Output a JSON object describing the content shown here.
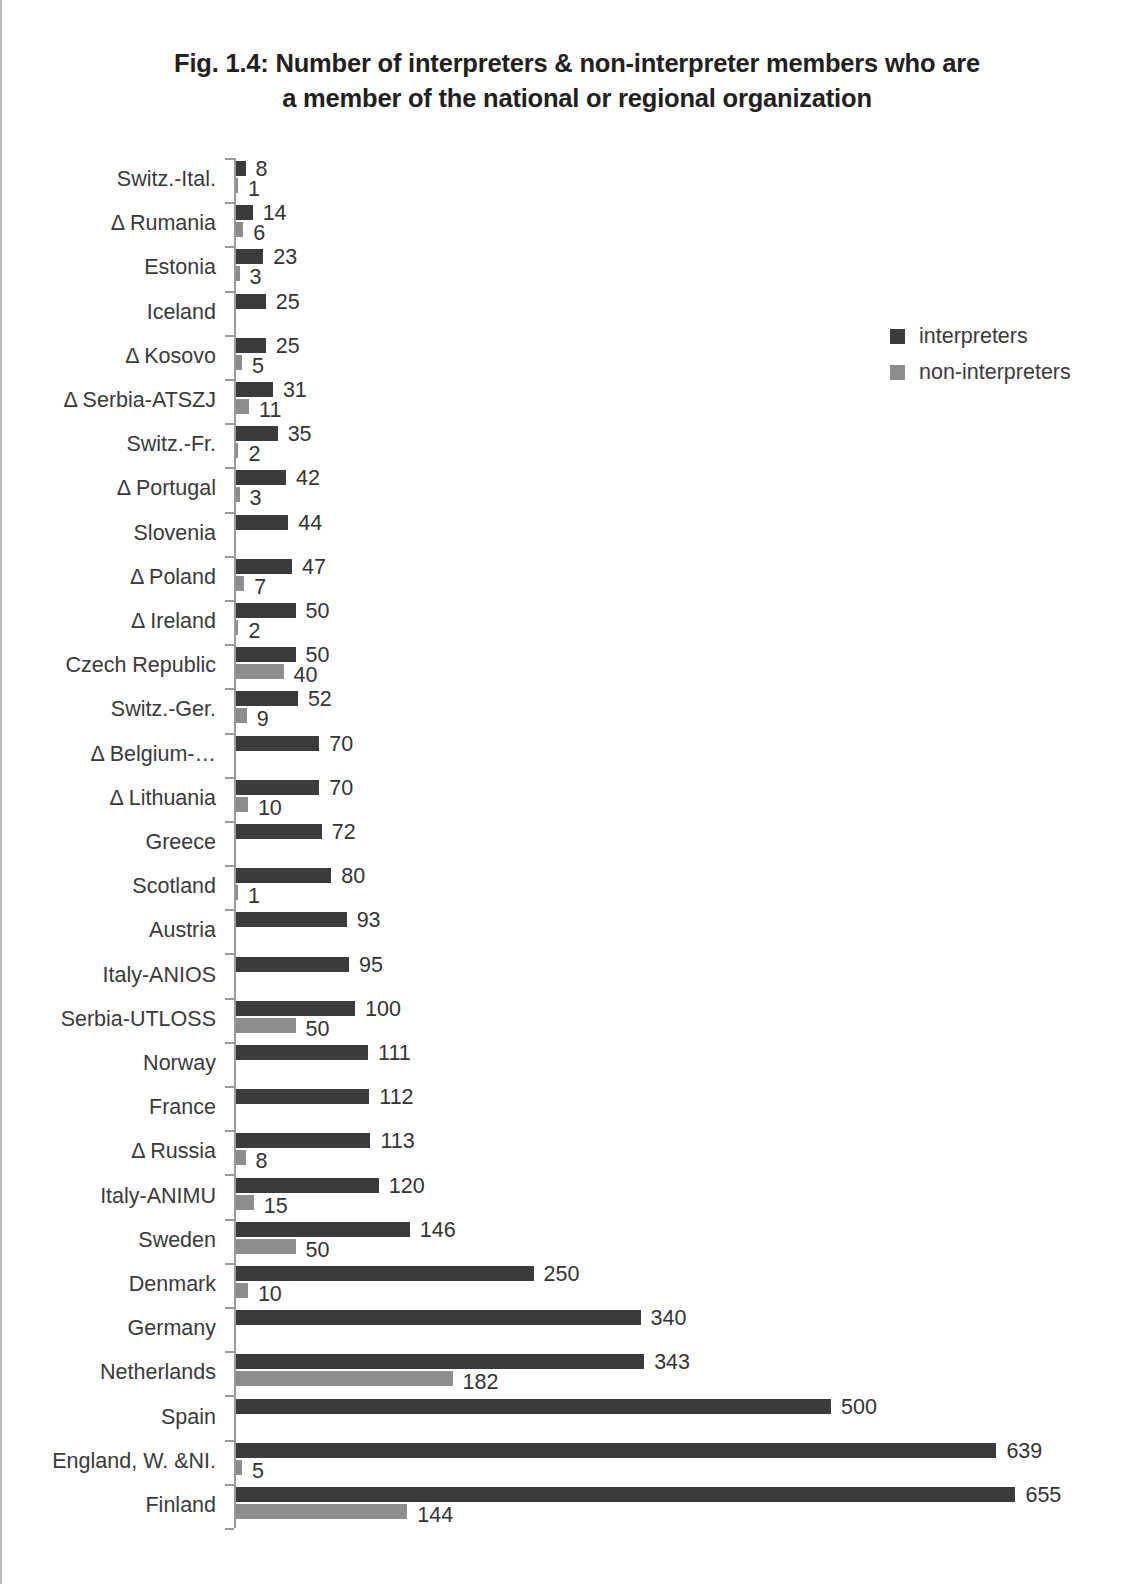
{
  "title": "Fig. 1.4: Number of interpreters & non-interpreter members who are a member of the national or regional organization",
  "title_line1": "Fig. 1.4: Number of interpreters & non-interpreter members who are",
  "title_line2": "a member of the national or regional organization",
  "legend": {
    "position": "right",
    "items": [
      {
        "label": "interpreters",
        "color": "#3b3b3b",
        "key": "interp"
      },
      {
        "label": "non-interpreters",
        "color": "#8d8d8d",
        "key": "noninterp"
      }
    ]
  },
  "chart_data": {
    "type": "bar",
    "orientation": "horizontal",
    "title": "Fig. 1.4: Number of interpreters & non-interpreter members who are a member of the national or regional organization",
    "xlabel": "",
    "ylabel": "",
    "grid": false,
    "xlim": [
      0,
      680
    ],
    "legend_position": "right",
    "categories": [
      "Switz.-Ital.",
      "Δ Rumania",
      "Estonia",
      "Iceland",
      "Δ Kosovo",
      "Δ Serbia-ATSZJ",
      "Switz.-Fr.",
      "Δ Portugal",
      "Slovenia",
      "Δ Poland",
      "Δ Ireland",
      "Czech Republic",
      "Switz.-Ger.",
      "Δ Belgium-…",
      "Δ Lithuania",
      "Greece",
      "Scotland",
      "Austria",
      "Italy-ANIOS",
      "Serbia-UTLOSS",
      "Norway",
      "France",
      "Δ Russia",
      "Italy-ANIMU",
      "Sweden",
      "Denmark",
      "Germany",
      "Netherlands",
      "Spain",
      "England, W. &NI.",
      "Finland"
    ],
    "series": [
      {
        "name": "interpreters",
        "color": "#3b3b3b",
        "values": [
          8,
          14,
          23,
          25,
          25,
          31,
          35,
          42,
          44,
          47,
          50,
          50,
          52,
          70,
          70,
          72,
          80,
          93,
          95,
          100,
          111,
          112,
          113,
          120,
          146,
          250,
          340,
          343,
          500,
          639,
          655
        ]
      },
      {
        "name": "non-interpreters",
        "color": "#8d8d8d",
        "values": [
          1,
          6,
          3,
          null,
          5,
          11,
          2,
          3,
          null,
          7,
          2,
          40,
          9,
          null,
          10,
          null,
          1,
          null,
          null,
          50,
          null,
          null,
          8,
          15,
          50,
          10,
          null,
          182,
          null,
          5,
          144
        ]
      }
    ]
  }
}
